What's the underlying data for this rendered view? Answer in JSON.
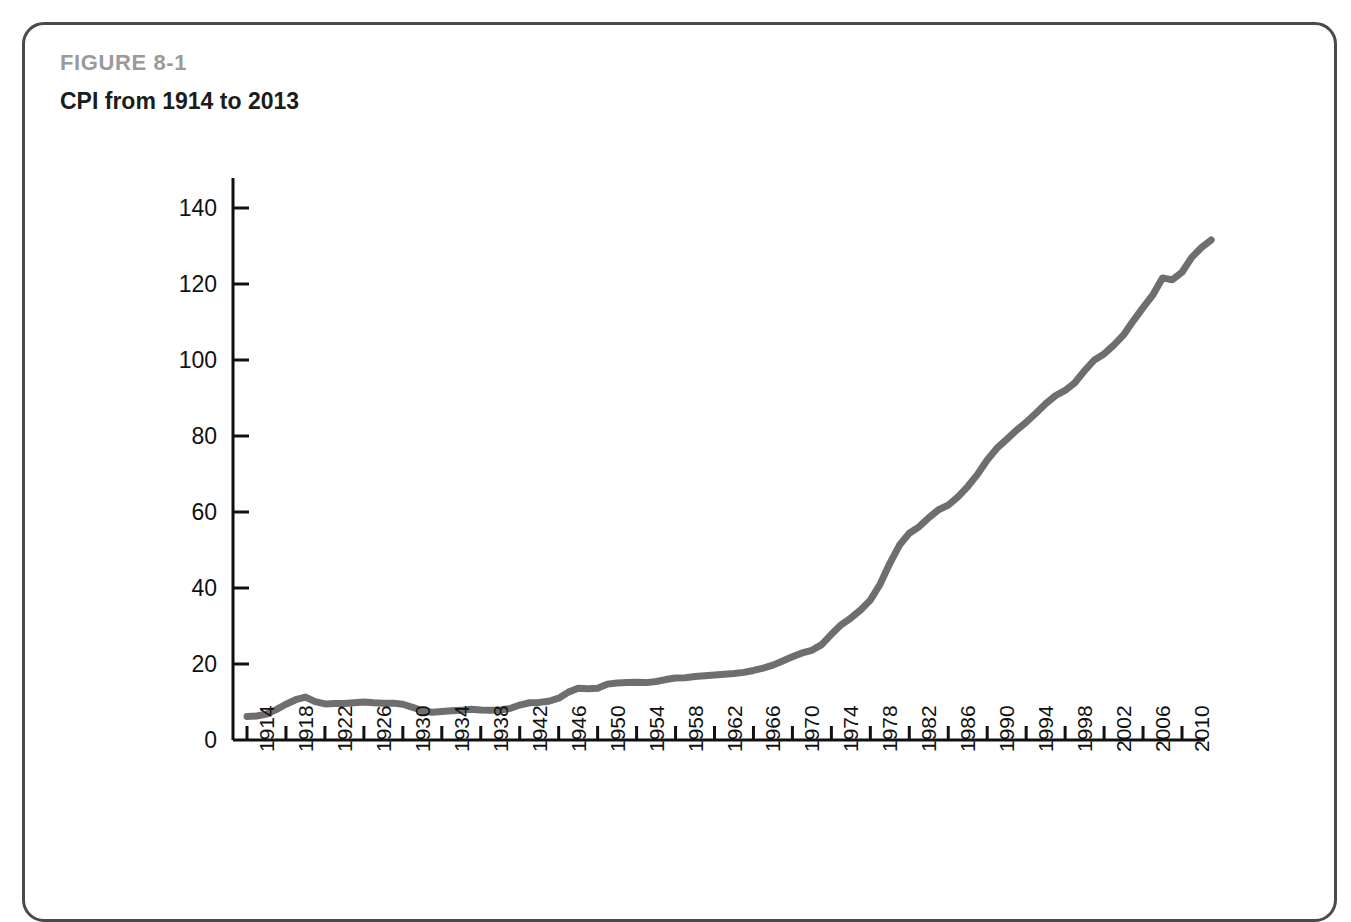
{
  "figure": {
    "number": "FIGURE 8-1",
    "title": "CPI from 1914 to 2013"
  },
  "colors": {
    "line": "#6e6e6e",
    "axis": "#111111",
    "frame": "#4a4a4a",
    "figure_number": "#9a9a9a",
    "title": "#1c1c1c",
    "background": "#ffffff"
  },
  "chart_data": {
    "type": "line",
    "title": "CPI from 1914 to 2013",
    "xlabel": "",
    "ylabel": "",
    "xlim": [
      1914,
      2013
    ],
    "ylim": [
      0,
      140
    ],
    "ytick_labels": [
      "0",
      "20",
      "40",
      "60",
      "80",
      "100",
      "120",
      "140"
    ],
    "yticks": [
      0,
      20,
      40,
      60,
      80,
      100,
      120,
      140
    ],
    "xtick_labels": [
      "1914",
      "1918",
      "1922",
      "1926",
      "1930",
      "1934",
      "1938",
      "1942",
      "1946",
      "1950",
      "1954",
      "1958",
      "1962",
      "1966",
      "1970",
      "1974",
      "1978",
      "1982",
      "1986",
      "1990",
      "1994",
      "1998",
      "2002",
      "2006",
      "2010"
    ],
    "xticks": [
      1914,
      1918,
      1922,
      1926,
      1930,
      1934,
      1938,
      1942,
      1946,
      1950,
      1954,
      1958,
      1962,
      1966,
      1970,
      1974,
      1978,
      1982,
      1986,
      1990,
      1994,
      1998,
      2002,
      2006,
      2010
    ],
    "xtick_rotation": -90,
    "grid": false,
    "legend": false,
    "series": [
      {
        "name": "CPI",
        "x": [
          1914,
          1915,
          1916,
          1917,
          1918,
          1919,
          1920,
          1921,
          1922,
          1923,
          1924,
          1925,
          1926,
          1927,
          1928,
          1929,
          1930,
          1931,
          1932,
          1933,
          1934,
          1935,
          1936,
          1937,
          1938,
          1939,
          1940,
          1941,
          1942,
          1943,
          1944,
          1945,
          1946,
          1947,
          1948,
          1949,
          1950,
          1951,
          1952,
          1953,
          1954,
          1955,
          1956,
          1957,
          1958,
          1959,
          1960,
          1961,
          1962,
          1963,
          1964,
          1965,
          1966,
          1967,
          1968,
          1969,
          1970,
          1971,
          1972,
          1973,
          1974,
          1975,
          1976,
          1977,
          1978,
          1979,
          1980,
          1981,
          1982,
          1983,
          1984,
          1985,
          1986,
          1987,
          1988,
          1989,
          1990,
          1991,
          1992,
          1993,
          1994,
          1995,
          1996,
          1997,
          1998,
          1999,
          2000,
          2001,
          2002,
          2003,
          2004,
          2005,
          2006,
          2007,
          2008,
          2009,
          2010,
          2011,
          2012,
          2013
        ],
        "values": [
          6.2,
          6.3,
          6.8,
          8.0,
          9.4,
          10.6,
          11.3,
          10.1,
          9.5,
          9.6,
          9.6,
          9.8,
          10.0,
          9.8,
          9.7,
          9.7,
          9.4,
          8.6,
          7.7,
          7.3,
          7.5,
          7.7,
          7.8,
          8.1,
          7.9,
          7.8,
          7.9,
          8.3,
          9.2,
          9.8,
          9.9,
          10.2,
          11.0,
          12.6,
          13.6,
          13.5,
          13.6,
          14.7,
          15.0,
          15.1,
          15.2,
          15.1,
          15.4,
          15.9,
          16.3,
          16.4,
          16.7,
          16.9,
          17.1,
          17.3,
          17.5,
          17.8,
          18.3,
          18.9,
          19.7,
          20.8,
          21.9,
          22.9,
          23.6,
          25.1,
          27.8,
          30.3,
          32.1,
          34.2,
          36.8,
          41.0,
          46.5,
          51.3,
          54.4,
          56.1,
          58.5,
          60.6,
          61.8,
          64.0,
          66.7,
          69.9,
          73.7,
          76.8,
          79.1,
          81.5,
          83.6,
          86.0,
          88.5,
          90.6,
          92.0,
          94.0,
          97.2,
          100.0,
          101.6,
          103.9,
          106.6,
          110.3,
          113.8,
          117.1,
          121.6,
          121.1,
          123.1,
          127.0,
          129.6,
          131.6
        ]
      }
    ]
  }
}
